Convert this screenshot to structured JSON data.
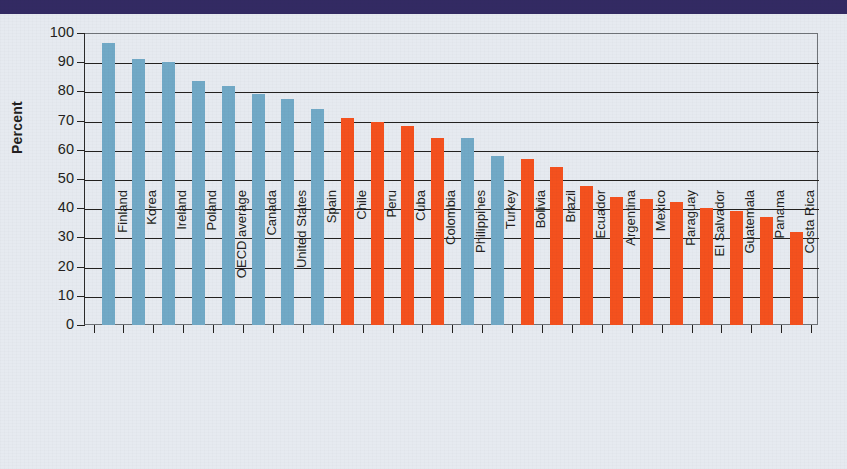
{
  "page": {
    "background_color": "#e6eaf0",
    "header_band_color": "#332a63"
  },
  "chart_data": {
    "type": "bar",
    "title": "",
    "subtitle": "",
    "xlabel": "",
    "ylabel": "Percent",
    "ylim": [
      0,
      100
    ],
    "ytick_step": 10,
    "ytick_labels": [
      "0",
      "10",
      "20",
      "30",
      "40",
      "50",
      "60",
      "70",
      "80",
      "90",
      "100"
    ],
    "grid": "horizontal",
    "legend": "none",
    "legend_position": "none",
    "series_colors": {
      "blue": "#71a9c6",
      "orange": "#f4511e"
    },
    "categories": [
      "Finland",
      "Korea",
      "Ireland",
      "Poland",
      "OECD average",
      "Canada",
      "United States",
      "Spain",
      "Chile",
      "Peru",
      "Cuba",
      "Colombia",
      "Philippines",
      "Turkey",
      "Bolivia",
      "Brazil",
      "Ecuador",
      "Argentina",
      "Mexico",
      "Paraguay",
      "El Salvador",
      "Guatemala",
      "Panama",
      "Costa Rica"
    ],
    "values": [
      96.5,
      91,
      90,
      83.5,
      82,
      79,
      77.5,
      74,
      71,
      69.5,
      68,
      64,
      64,
      58,
      57,
      54,
      47.5,
      44,
      43,
      42,
      40,
      39,
      37,
      32
    ],
    "group_colors": [
      "blue",
      "blue",
      "blue",
      "blue",
      "blue",
      "blue",
      "blue",
      "blue",
      "orange",
      "orange",
      "orange",
      "orange",
      "blue",
      "blue",
      "orange",
      "orange",
      "orange",
      "orange",
      "orange",
      "orange",
      "orange",
      "orange",
      "orange",
      "orange"
    ]
  }
}
